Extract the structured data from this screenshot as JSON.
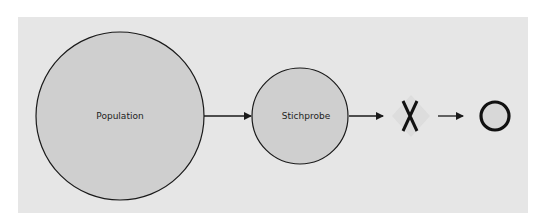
{
  "diagram": {
    "nodes": [
      {
        "id": "population",
        "label": "Population",
        "shape": "circle"
      },
      {
        "id": "stichprobe",
        "label": "Stichprobe",
        "shape": "circle"
      },
      {
        "id": "x",
        "label": "X",
        "shape": "symbol"
      },
      {
        "id": "o",
        "label": "O",
        "shape": "symbol"
      }
    ],
    "edges": [
      {
        "from": "population",
        "to": "stichprobe"
      },
      {
        "from": "stichprobe",
        "to": "x"
      },
      {
        "from": "x",
        "to": "o"
      }
    ],
    "colors": {
      "panel": "#e6e6e6",
      "circle_fill": "#cfcfcf",
      "stroke": "#1a1a1a"
    }
  }
}
